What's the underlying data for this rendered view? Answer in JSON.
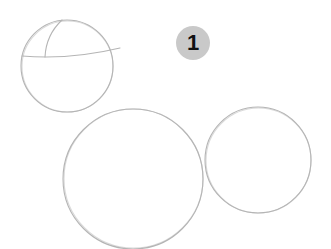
{
  "step": {
    "number": "1",
    "badge_color": "#c9c9c9",
    "text_color": "#111111"
  },
  "sketch": {
    "stroke_color": "#b5b5b5",
    "shapes": [
      {
        "name": "head-circle",
        "cx": 67,
        "cy": 66,
        "r": 46
      },
      {
        "name": "body-circle",
        "cx": 133,
        "cy": 179,
        "r": 70
      },
      {
        "name": "side-circle",
        "cx": 258,
        "cy": 160,
        "r": 53
      }
    ],
    "guidelines": [
      {
        "name": "horizontal-guideline",
        "d": "M22 56 Q70 60 120 48"
      },
      {
        "name": "vertical-guideline",
        "d": "M45 57 Q46 35 62 20"
      }
    ]
  }
}
